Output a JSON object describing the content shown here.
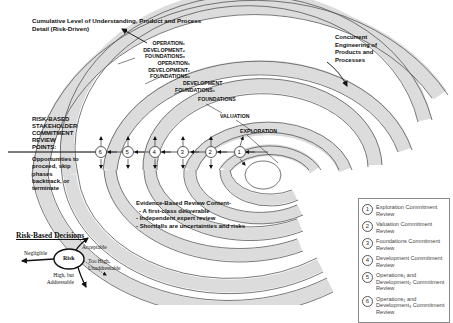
{
  "diagram": {
    "title_line1": "Cumulative Level of Understanding, Product and Process",
    "title_line2": "Detail (Risk-Driven)",
    "concurrent_label": [
      "Concurrent",
      "Engineering of",
      "Products and",
      "Processes"
    ],
    "phase_labels": {
      "op1_line1": "OPERATION₁",
      "op1_line2": "DEVELOPMENT₂",
      "op1_line3": "FOUNDATIONS₃",
      "op2_line1": "OPERATION₁",
      "op2_line2": "DEVELOPMENT₁",
      "op2_line3": "FOUNDATIONS₂",
      "dev_line1": "DEVELOPMENT",
      "dev_line2": "FOUNDATIONS₁",
      "foundations": "FOUNDATIONS",
      "valuation": "VALUATION",
      "exploration": "EXPLORATION"
    },
    "review_points_label": [
      "RISK-BASED",
      "STAKEHOLDER",
      "COMMITMENT",
      "REVIEW",
      "POINTS:"
    ],
    "opportunities_label": [
      "Opportunities to",
      "proceed, skip",
      "phases",
      "backtrack, or",
      "terminate"
    ],
    "review_points": [
      "1",
      "2",
      "3",
      "4",
      "5",
      "6"
    ],
    "evidence": {
      "heading": "Evidence-Based Review Content-",
      "items": [
        "- A first-class deliverable",
        "- Independent expert review",
        "- Shortfalls are uncertainties and risks"
      ]
    },
    "risk_decisions": {
      "heading": "Risk-Based Decisions",
      "center": "Risk",
      "outcomes": {
        "acceptable": "Acceptable",
        "negligible": "Negligible",
        "too_high_1": "Too High,",
        "too_high_2": "Unaddressable",
        "high_but_1": "High, but",
        "high_but_2": "Addressable"
      }
    },
    "legend": [
      {
        "num": "1",
        "text": "Exploration Commitment Review"
      },
      {
        "num": "2",
        "text": "Valuation Commitment Review"
      },
      {
        "num": "3",
        "text": "Foundations Commitment Review"
      },
      {
        "num": "4",
        "text": "Development Commitment Review"
      },
      {
        "num": "5",
        "text": "Operations₁ and Development₂ Commitment Review"
      },
      {
        "num": "6",
        "text": "Operations₂ and Development₃ Commitment Review"
      }
    ],
    "colors": {
      "band_fill": "#dcdcdc",
      "stroke": "#555555",
      "text": "#111111"
    }
  }
}
